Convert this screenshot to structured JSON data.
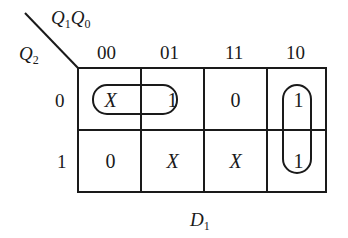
{
  "kmap": {
    "title": "D",
    "title_sub": "1",
    "row_var": {
      "base": "Q",
      "sub": "2"
    },
    "col_vars": [
      {
        "base": "Q",
        "sub": "1"
      },
      {
        "base": "Q",
        "sub": "0"
      }
    ],
    "col_headers": [
      "00",
      "01",
      "11",
      "10"
    ],
    "row_headers": [
      "0",
      "1"
    ],
    "cells": [
      [
        "X",
        "1",
        "0",
        "1"
      ],
      [
        "0",
        "X",
        "X",
        "1"
      ]
    ],
    "groupings": [
      {
        "name": "row0-cols00-01",
        "cells": [
          [
            0,
            0
          ],
          [
            0,
            1
          ]
        ]
      },
      {
        "name": "col10-rows0-1",
        "cells": [
          [
            0,
            3
          ],
          [
            1,
            3
          ]
        ]
      }
    ],
    "line_color": "#1a1a1a"
  }
}
